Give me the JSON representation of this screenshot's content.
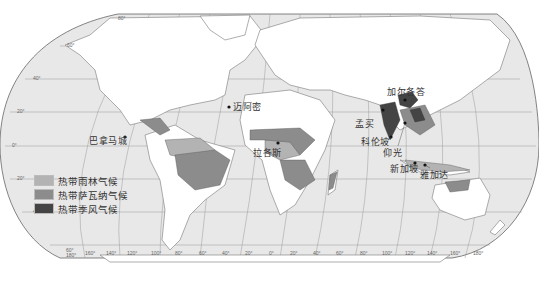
{
  "map": {
    "title": "",
    "colors": {
      "ocean": "#e8e8e8",
      "land": "#ffffff",
      "rainforest": "#b3b3b3",
      "savanna": "#8c8c8c",
      "monsoon": "#444444",
      "grid": "#9a9a9a",
      "border": "#666666"
    },
    "legend": [
      {
        "label": "热带雨林气候",
        "color": "#b3b3b3"
      },
      {
        "label": "热带萨瓦纳气候",
        "color": "#8c8c8c"
      },
      {
        "label": "热带季风气候",
        "color": "#444444"
      }
    ],
    "cities": [
      {
        "name": "迈阿密",
        "x": 233,
        "y": 103
      },
      {
        "name": "巴拿马城",
        "x": 89,
        "y": 136
      },
      {
        "name": "拉各斯",
        "x": 253,
        "y": 150
      },
      {
        "name": "加尔各答",
        "x": 387,
        "y": 88
      },
      {
        "name": "孟买",
        "x": 382,
        "y": 119
      },
      {
        "name": "科伦坡",
        "x": 361,
        "y": 137
      },
      {
        "name": "仰光",
        "x": 385,
        "y": 148
      },
      {
        "name": "新加坡",
        "x": 400,
        "y": 161
      },
      {
        "name": "雅加达",
        "x": 420,
        "y": 169
      }
    ],
    "latitude_labels": [
      "80°",
      "60°",
      "40°",
      "20°",
      "0°",
      "20°",
      "40°",
      "60°"
    ],
    "longitude_labels": [
      "180°",
      "160°",
      "140°",
      "120°",
      "100°",
      "80°",
      "60°",
      "40°",
      "20°",
      "0°",
      "20°",
      "40°",
      "60°",
      "80°",
      "100°",
      "120°",
      "140°",
      "160°",
      "180°"
    ]
  }
}
